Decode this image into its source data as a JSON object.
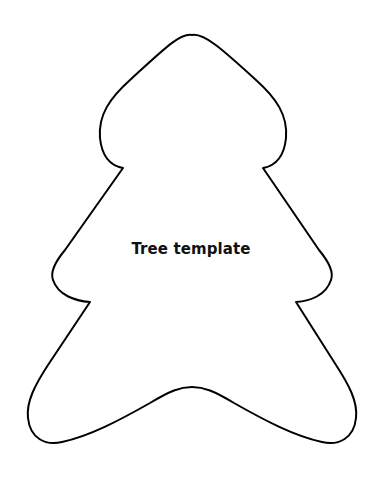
{
  "template": {
    "title": "Tree template",
    "shape": "christmas-tree-outline",
    "stroke_color": "#000000",
    "fill_color": "#ffffff"
  }
}
